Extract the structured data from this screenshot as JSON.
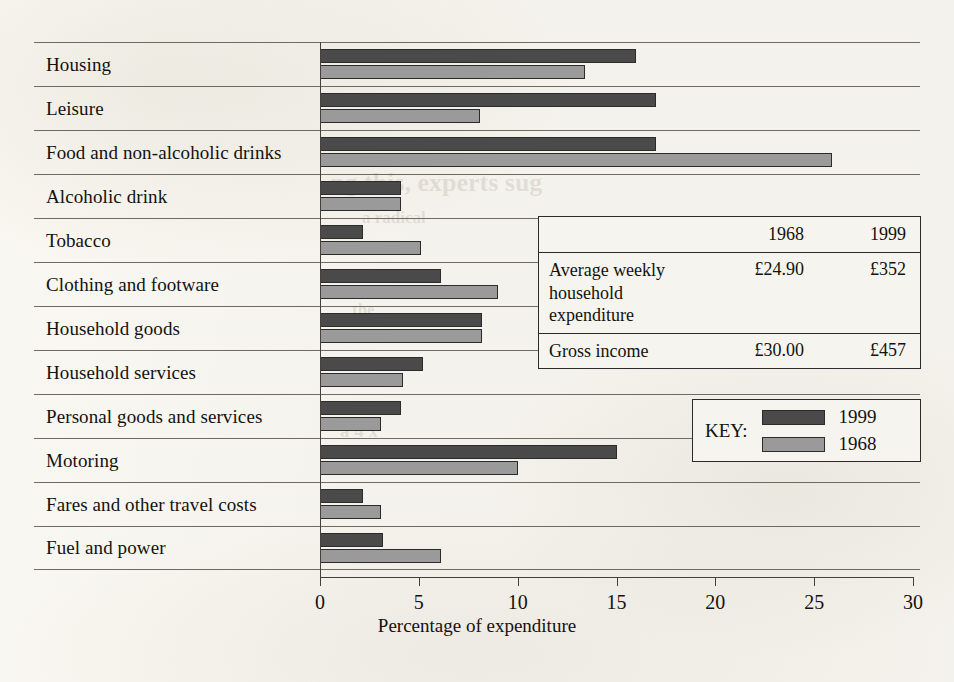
{
  "chart_data": {
    "type": "bar",
    "orientation": "horizontal",
    "title": "",
    "xlabel": "Percentage of expenditure",
    "ylabel": "",
    "xlim": [
      0,
      30
    ],
    "xticks": [
      0,
      5,
      10,
      15,
      20,
      25,
      30
    ],
    "grid": false,
    "legend_position": "inside-right",
    "categories": [
      "Housing",
      "Leisure",
      "Food and non-alcoholic drinks",
      "Alcoholic drink",
      "Tobacco",
      "Clothing and footware",
      "Household goods",
      "Household services",
      "Personal goods and services",
      "Motoring",
      "Fares and other travel costs",
      "Fuel and power"
    ],
    "series": [
      {
        "name": "1999",
        "color": "#4a4a4a",
        "values": [
          16.0,
          17.0,
          17.0,
          4.1,
          2.2,
          6.1,
          8.2,
          5.2,
          4.1,
          15.0,
          2.2,
          3.2
        ]
      },
      {
        "name": "1968",
        "color": "#9a9a9a",
        "values": [
          13.4,
          8.1,
          25.9,
          4.1,
          5.1,
          9.0,
          8.2,
          4.2,
          3.1,
          10.0,
          3.1,
          6.1
        ]
      }
    ]
  },
  "legend": {
    "key_word": "KEY:",
    "items": [
      {
        "label": "1999",
        "swatch": "dark-swatch"
      },
      {
        "label": "1968",
        "swatch": "light-swatch"
      }
    ]
  },
  "data_table": {
    "header": {
      "label": "",
      "col1": "1968",
      "col2": "1999"
    },
    "rows": [
      {
        "label": "Average weekly household expenditure",
        "col1": "£24.90",
        "col2": "£352"
      },
      {
        "label": "Gross income",
        "col1": "£30.00",
        "col2": "£457"
      }
    ]
  },
  "page_showthrough": [
    {
      "text": "ng this, experts sug",
      "x": 330,
      "y": 168,
      "size": 26
    },
    {
      "text": "a radical",
      "x": 362,
      "y": 208,
      "size": 17
    },
    {
      "text": "the",
      "x": 352,
      "y": 300,
      "size": 17
    },
    {
      "text": "a 4 x",
      "x": 340,
      "y": 420,
      "size": 19
    }
  ]
}
